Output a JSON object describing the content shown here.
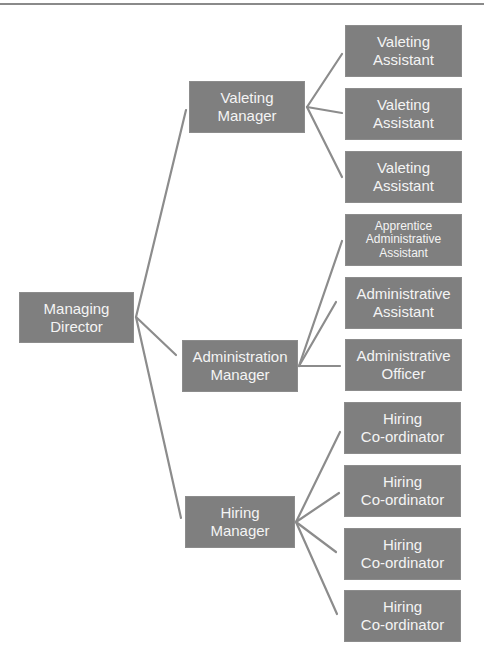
{
  "colors": {
    "box_fill": "#7f7f7f",
    "box_text": "#f4f4f4",
    "connector": "#8c8c8c",
    "background": "#ffffff"
  },
  "chart": {
    "type": "org-chart",
    "root": {
      "id": "managing-director",
      "lines": [
        "Managing",
        "Director"
      ],
      "children": [
        {
          "id": "valeting-manager",
          "lines": [
            "Valeting",
            "Manager"
          ],
          "children": [
            {
              "lines": [
                "Valeting",
                "Assistant"
              ]
            },
            {
              "lines": [
                "Valeting",
                "Assistant"
              ]
            },
            {
              "lines": [
                "Valeting",
                "Assistant"
              ]
            }
          ]
        },
        {
          "id": "administration-manager",
          "lines": [
            "Administration",
            "Manager"
          ],
          "children": [
            {
              "lines": [
                "Apprentice",
                "Administrative",
                "Assistant"
              ]
            },
            {
              "lines": [
                "Administrative",
                "Assistant"
              ]
            },
            {
              "lines": [
                "Administrative",
                "Officer"
              ]
            }
          ]
        },
        {
          "id": "hiring-manager",
          "lines": [
            "Hiring",
            "Manager"
          ],
          "children": [
            {
              "lines": [
                "Hiring",
                "Co-ordinator"
              ]
            },
            {
              "lines": [
                "Hiring",
                "Co-ordinator"
              ]
            },
            {
              "lines": [
                "Hiring",
                "Co-ordinator"
              ]
            },
            {
              "lines": [
                "Hiring",
                "Co-ordinator"
              ]
            }
          ]
        }
      ]
    }
  }
}
